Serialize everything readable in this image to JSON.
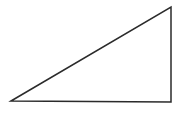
{
  "diagram": {
    "shape": "right-triangle",
    "background": "#ffffff",
    "stroke_color": "#2b2b2b",
    "stroke_width": 1.5,
    "fill": "none",
    "vertices": [
      {
        "name": "bottom-left",
        "x": 11,
        "y": 101
      },
      {
        "name": "top-right",
        "x": 171,
        "y": 7
      },
      {
        "name": "bottom-right",
        "x": 171,
        "y": 102
      }
    ]
  }
}
